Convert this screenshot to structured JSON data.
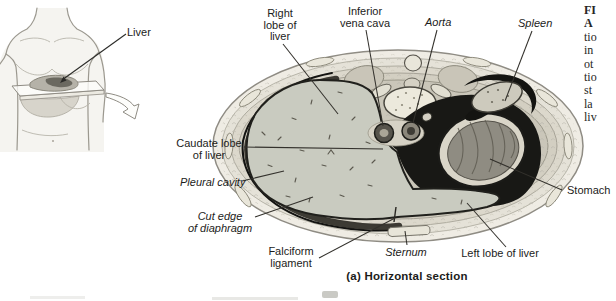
{
  "figure": {
    "description": "Horizontal (transverse) section through the abdomen showing the liver",
    "caption": "(a) Horizontal section"
  },
  "inset": {
    "liver_label": "Liver"
  },
  "labels": {
    "right_lobe": {
      "line1": "Right",
      "line2": "lobe of",
      "line3": "liver"
    },
    "inferior_vena_cava": {
      "line1": "Inferior",
      "line2": "vena cava"
    },
    "aorta": "Aorta",
    "spleen": "Spleen",
    "caudate_lobe": {
      "line1": "Caudate lobe",
      "line2": "of liver"
    },
    "pleural_cavity": "Pleural cavity",
    "cut_edge_of_diaphragm": {
      "line1": "Cut edge",
      "line2": "of diaphragm"
    },
    "falciform_ligament": {
      "line1": "Falciform",
      "line2": "ligament"
    },
    "sternum": "Sternum",
    "left_lobe": "Left lobe of liver",
    "stomach": "Stomach"
  },
  "side_text": {
    "lines": [
      "FI",
      "A",
      "tio",
      "in",
      "ot",
      "tio",
      "st",
      "la",
      "liv"
    ]
  },
  "colors": {
    "ink": "#1c1c1a",
    "leader_line": "#33312c",
    "body_wall": "#efece4",
    "liver": "#c9cbc0",
    "stomach_wall": "#d9d5c8",
    "stomach_interior": "#8f8c82",
    "cavity_black": "#181815",
    "spleen": "#cdcabd",
    "vertebra": "#ece9dc"
  }
}
